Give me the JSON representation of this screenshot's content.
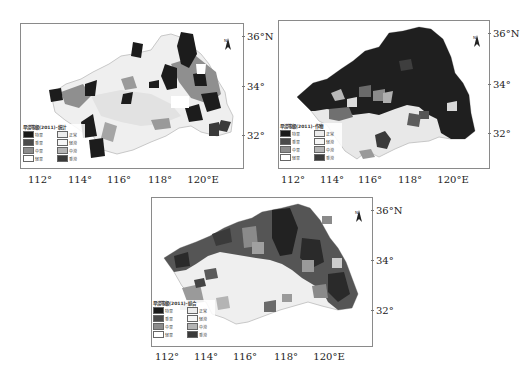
{
  "figure": {
    "panels": [
      {
        "id": "statistics",
        "legend_title": "旱涝等级(2011)-统计",
        "frame": {
          "left": 20,
          "top": 23,
          "width": 222,
          "height": 144
        },
        "lon_labels": [
          {
            "text": "112°",
            "x": 40
          },
          {
            "text": "114°",
            "x": 80
          },
          {
            "text": "116°",
            "x": 119
          },
          {
            "text": "118°",
            "x": 160
          },
          {
            "text": "120°E",
            "x": 200
          }
        ],
        "lon_label_y": 174,
        "lat_labels": [
          {
            "text": "36°N",
            "y": 36
          },
          {
            "text": "34°",
            "y": 86
          },
          {
            "text": "32°",
            "y": 135
          }
        ],
        "lat_label_x": 246
      },
      {
        "id": "crop",
        "legend_title": "旱涝等级(2011)-作物",
        "frame": {
          "left": 278,
          "top": 20,
          "width": 210,
          "height": 147
        },
        "lon_labels": [
          {
            "text": "112°",
            "x": 293
          },
          {
            "text": "114°",
            "x": 332
          },
          {
            "text": "116°",
            "x": 370
          },
          {
            "text": "118°",
            "x": 410
          },
          {
            "text": "120°E",
            "x": 450
          }
        ],
        "lon_label_y": 174,
        "lat_labels": [
          {
            "text": "36°N",
            "y": 33
          },
          {
            "text": "34°",
            "y": 84
          },
          {
            "text": "32°",
            "y": 133
          }
        ],
        "lat_label_x": 492
      },
      {
        "id": "composite",
        "legend_title": "旱涝等级(2011)-综合",
        "frame": {
          "left": 151,
          "top": 197,
          "width": 220,
          "height": 148
        },
        "lon_labels": [
          {
            "text": "112°",
            "x": 167
          },
          {
            "text": "114°",
            "x": 206
          },
          {
            "text": "116°",
            "x": 245
          },
          {
            "text": "118°",
            "x": 286
          },
          {
            "text": "120°E",
            "x": 326
          }
        ],
        "lon_label_y": 351,
        "lat_labels": [
          {
            "text": "36°N",
            "y": 210
          },
          {
            "text": "34°",
            "y": 260
          },
          {
            "text": "32°",
            "y": 310
          }
        ],
        "lat_label_x": 375
      }
    ],
    "legend": {
      "items": [
        {
          "label": "特旱",
          "color": "#1a1a1a"
        },
        {
          "label": "正常",
          "color": "#ececec"
        },
        {
          "label": "重旱",
          "color": "#4a4a4a"
        },
        {
          "label": "轻涝",
          "color": "#f6f6f6"
        },
        {
          "label": "中旱",
          "color": "#8c8c8c"
        },
        {
          "label": "中涝",
          "color": "#b4b4b4"
        },
        {
          "label": "轻旱",
          "color": "#ffffff"
        },
        {
          "label": "重涝",
          "color": "#3a3a3a"
        }
      ]
    },
    "north_arrow": {
      "label": "N"
    }
  }
}
